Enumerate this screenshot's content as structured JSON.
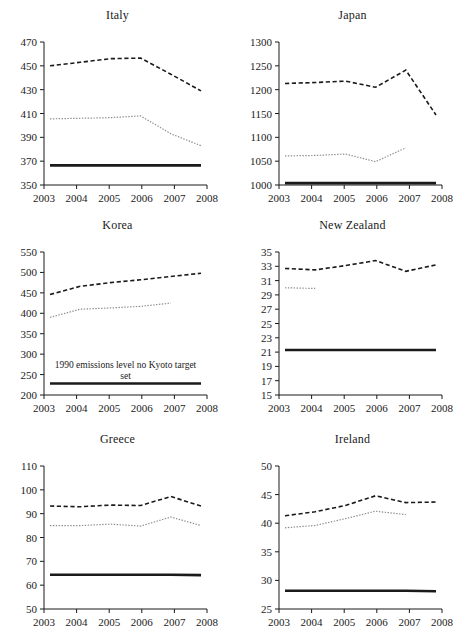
{
  "figure": {
    "background": "#ffffff",
    "series_styles": {
      "dashed": {
        "name": "actual emissions",
        "color": "#1a1a1a",
        "style": "dashed"
      },
      "dotted": {
        "name": "emissions excluding LULUCF / adjusted",
        "color": "#8c8c8c",
        "style": "dotted"
      },
      "solid": {
        "name": "1990 emissions level / Kyoto target",
        "color": "#1a1a1a",
        "style": "solid"
      }
    }
  },
  "chart_data": [
    {
      "type": "line",
      "title": "Italy",
      "xlabel": "",
      "ylabel": "",
      "x": [
        2003,
        2004,
        2005,
        2006,
        2007,
        2008
      ],
      "xticks": [
        "2003",
        "2004",
        "2005",
        "2006",
        "2007",
        "2008"
      ],
      "ylim": [
        350,
        470
      ],
      "yticks": [
        350,
        370,
        390,
        410,
        430,
        450,
        470
      ],
      "grid": false,
      "legend": "none",
      "series": [
        {
          "name": "dashed",
          "style": "dashed",
          "values": [
            450.0,
            453.0,
            456.0,
            456.5,
            443.0,
            429.0
          ]
        },
        {
          "name": "dotted",
          "style": "dotted",
          "values": [
            405.5,
            406.0,
            406.5,
            408.0,
            393.0,
            383.0
          ]
        },
        {
          "name": "solid",
          "style": "solid",
          "values": [
            366.5,
            366.5,
            366.5,
            366.5,
            366.5,
            366.5
          ]
        }
      ],
      "annotation": ""
    },
    {
      "type": "line",
      "title": "Japan",
      "xlabel": "",
      "ylabel": "",
      "x": [
        2003,
        2004,
        2005,
        2006,
        2007,
        2008
      ],
      "xticks": [
        "2003",
        "2004",
        "2005",
        "2006",
        "2007",
        "2008"
      ],
      "ylim": [
        1000,
        1300
      ],
      "yticks": [
        1000,
        1050,
        1100,
        1150,
        1200,
        1250,
        1300
      ],
      "grid": false,
      "legend": "none",
      "series": [
        {
          "name": "dashed",
          "style": "dashed",
          "values": [
            1213,
            1215,
            1218,
            1205,
            1241,
            1147
          ]
        },
        {
          "name": "dotted",
          "style": "dotted",
          "values": [
            1061,
            1062,
            1065,
            1049,
            1078,
            null
          ]
        },
        {
          "name": "solid",
          "style": "solid",
          "values": [
            1004,
            1004,
            1004,
            1004,
            1004,
            1004
          ]
        }
      ],
      "annotation": ""
    },
    {
      "type": "line",
      "title": "Korea",
      "xlabel": "",
      "ylabel": "",
      "x": [
        2003,
        2004,
        2005,
        2006,
        2007,
        2008
      ],
      "xticks": [
        "2003",
        "2004",
        "2005",
        "2006",
        "2007",
        "2008"
      ],
      "ylim": [
        200,
        550
      ],
      "yticks": [
        200,
        250,
        300,
        350,
        400,
        450,
        500,
        550
      ],
      "grid": false,
      "legend": "none",
      "series": [
        {
          "name": "dashed",
          "style": "dashed",
          "values": [
            446,
            466,
            475,
            482,
            490,
            498
          ]
        },
        {
          "name": "dotted",
          "style": "dotted",
          "values": [
            390,
            410,
            413,
            417,
            425,
            null
          ]
        },
        {
          "name": "solid",
          "style": "solid",
          "values": [
            228,
            228,
            228,
            228,
            228,
            228
          ]
        }
      ],
      "annotation": "1990 emissions level no Kyoto target set"
    },
    {
      "type": "line",
      "title": "New Zealand",
      "xlabel": "",
      "ylabel": "",
      "x": [
        2003,
        2004,
        2005,
        2006,
        2007,
        2008
      ],
      "xticks": [
        "2003",
        "2004",
        "2005",
        "2006",
        "2007",
        "2008"
      ],
      "ylim": [
        15,
        35
      ],
      "yticks": [
        15,
        17,
        19,
        21,
        23,
        25,
        27,
        29,
        31,
        33,
        35
      ],
      "grid": false,
      "legend": "none",
      "series": [
        {
          "name": "dashed",
          "style": "dashed",
          "values": [
            32.7,
            32.5,
            33.1,
            33.8,
            32.3,
            33.2
          ]
        },
        {
          "name": "dotted",
          "style": "dotted",
          "values": [
            30.0,
            29.9,
            null,
            null,
            null,
            null
          ]
        },
        {
          "name": "solid",
          "style": "solid",
          "values": [
            21.3,
            21.3,
            21.3,
            21.3,
            21.3,
            21.3
          ]
        }
      ],
      "annotation": ""
    },
    {
      "type": "line",
      "title": "Greece",
      "xlabel": "",
      "ylabel": "",
      "x": [
        2003,
        2004,
        2005,
        2006,
        2007,
        2008
      ],
      "xticks": [
        "2003",
        "2004",
        "2005",
        "2006",
        "2007",
        "2008"
      ],
      "ylim": [
        50,
        110
      ],
      "yticks": [
        50,
        60,
        70,
        80,
        90,
        100,
        110
      ],
      "grid": false,
      "legend": "none",
      "series": [
        {
          "name": "dashed",
          "style": "dashed",
          "values": [
            93.2,
            92.9,
            93.6,
            93.4,
            97.2,
            93.2
          ]
        },
        {
          "name": "dotted",
          "style": "dotted",
          "values": [
            85.0,
            85.0,
            85.6,
            84.8,
            88.6,
            85.0
          ]
        },
        {
          "name": "solid",
          "style": "solid",
          "values": [
            64.4,
            64.4,
            64.4,
            64.4,
            64.4,
            64.2
          ]
        }
      ],
      "annotation": ""
    },
    {
      "type": "line",
      "title": "Ireland",
      "xlabel": "",
      "ylabel": "",
      "x": [
        2003,
        2004,
        2005,
        2006,
        2007,
        2008
      ],
      "xticks": [
        "2003",
        "2004",
        "2005",
        "2006",
        "2007",
        "2008"
      ],
      "ylim": [
        25,
        50
      ],
      "yticks": [
        25,
        30,
        35,
        40,
        45,
        50
      ],
      "grid": false,
      "legend": "none",
      "series": [
        {
          "name": "dashed",
          "style": "dashed",
          "values": [
            41.3,
            42.0,
            43.1,
            44.8,
            43.6,
            43.7
          ]
        },
        {
          "name": "dotted",
          "style": "dotted",
          "values": [
            39.2,
            39.6,
            40.8,
            42.1,
            41.5,
            null
          ]
        },
        {
          "name": "solid",
          "style": "solid",
          "values": [
            28.2,
            28.2,
            28.2,
            28.2,
            28.2,
            28.1
          ]
        }
      ],
      "annotation": ""
    }
  ]
}
